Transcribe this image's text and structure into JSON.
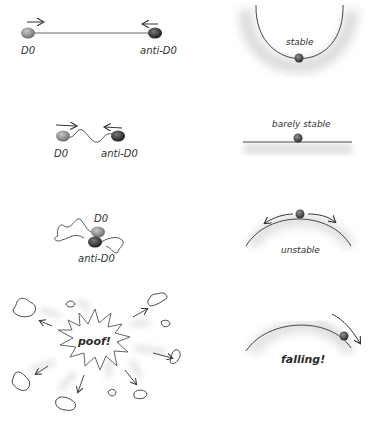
{
  "panels": {
    "row1": {
      "left": {
        "particle_label": "D0",
        "antiparticle_label": "anti-D0"
      },
      "right": {
        "label": "stable"
      }
    },
    "row2": {
      "left": {
        "particle_label": "D0",
        "antiparticle_label": "anti-D0"
      },
      "right": {
        "label": "barely stable"
      }
    },
    "row3": {
      "left": {
        "particle_label": "D0",
        "antiparticle_label": "anti-D0"
      },
      "right": {
        "label": "unstable"
      }
    },
    "row4": {
      "left": {
        "burst_label": "poof!"
      },
      "right": {
        "label": "falling!"
      }
    }
  },
  "colors": {
    "particle": "#8a8a8a",
    "antiparticle": "#3a3a3a",
    "line": "#444444",
    "shadow": "#d8d8d8"
  }
}
